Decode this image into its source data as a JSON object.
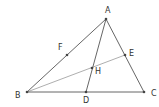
{
  "diagram": {
    "type": "geometry-triangle",
    "points": {
      "A": {
        "label": "A",
        "x": 106,
        "y": 19,
        "lx": 108,
        "ly": 13
      },
      "B": {
        "label": "B",
        "x": 27,
        "y": 92,
        "lx": 19,
        "ly": 98
      },
      "C": {
        "label": "C",
        "x": 144,
        "y": 92,
        "lx": 154,
        "ly": 96
      },
      "D": {
        "label": "D",
        "x": 86,
        "y": 92,
        "lx": 86,
        "ly": 102
      },
      "E": {
        "label": "E",
        "x": 125,
        "y": 55,
        "lx": 132,
        "ly": 55
      },
      "F": {
        "label": "F",
        "x": 67,
        "y": 55,
        "lx": 61,
        "ly": 50
      },
      "H": {
        "label": "H",
        "x": 92,
        "y": 68,
        "lx": 98,
        "ly": 74
      }
    },
    "segments": [
      {
        "from": "A",
        "to": "B"
      },
      {
        "from": "B",
        "to": "C"
      },
      {
        "from": "C",
        "to": "A"
      },
      {
        "from": "A",
        "to": "D"
      },
      {
        "from": "B",
        "to": "E"
      }
    ],
    "colors": {
      "line": "#555555",
      "text": "#333333",
      "background": "#ffffff"
    }
  }
}
